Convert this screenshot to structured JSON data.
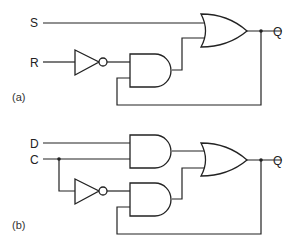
{
  "diagram": {
    "panel_a": {
      "caption": "(a)",
      "inputs": {
        "s": "S",
        "r": "R"
      },
      "output": "Q",
      "gates": [
        "NOT",
        "AND",
        "OR"
      ]
    },
    "panel_b": {
      "caption": "(b)",
      "inputs": {
        "d": "D",
        "c": "C"
      },
      "output": "Q",
      "gates": [
        "NOT",
        "AND",
        "AND",
        "OR"
      ]
    },
    "colors": {
      "stroke": "#222222",
      "background": "#ffffff"
    }
  }
}
